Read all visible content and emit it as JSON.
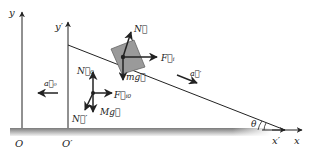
{
  "diagram": {
    "colors": {
      "line": "#222222",
      "block_fill": "#9a9a9a",
      "ground_top": "#7a7a7a",
      "ground_bottom": "#f2f2f2"
    },
    "axes": {
      "ground_frame": {
        "y_label": "y",
        "x_label": "x",
        "origin_label": "O"
      },
      "wedge_frame": {
        "y_label": "y′",
        "x_label": "x′",
        "origin_label": "O′"
      }
    },
    "angle_label": "θ",
    "block_forces": {
      "normal": "N⃗",
      "inertial": "F⃗ᵢ",
      "weight": "mg⃗"
    },
    "wedge_forces": {
      "normal_block": "N⃗₀",
      "inertial": "F⃗ᵢ₀",
      "weight": "Mg⃗",
      "ground_normal": "N⃗′"
    },
    "accelerations": {
      "wedge": "a⃗₀",
      "block_relative": "a⃗′"
    }
  }
}
